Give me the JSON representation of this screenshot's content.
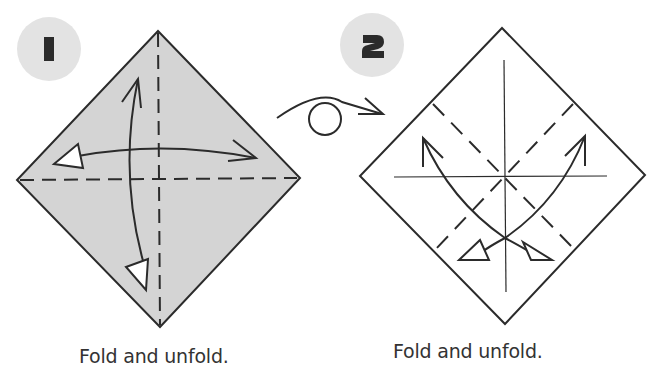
{
  "steps": [
    {
      "number": "1",
      "caption": "Fold and unfold.",
      "paper_color": "#d4d4d4",
      "folds": [
        "vertical valley fold (dashed)",
        "horizontal valley fold (dashed)"
      ],
      "arrows": [
        "double-headed vertical curved arrow",
        "double-headed horizontal curved arrow"
      ]
    },
    {
      "number": "2",
      "caption": "Fold and unfold.",
      "paper_color": "#ffffff",
      "folds": [
        "diagonal valley fold upper-left to lower-right (dashed)",
        "diagonal valley fold upper-right to lower-left (dashed)",
        "vertical crease line",
        "horizontal crease line"
      ],
      "arrows": [
        "curved double-headed arrow from upper-left to bottom",
        "curved double-headed arrow from upper-right to bottom"
      ]
    }
  ],
  "transition": {
    "symbol": "turn-over-arrow"
  },
  "colors": {
    "line": "#2b2b2b",
    "badge": "#e3e3e3",
    "paper_colored": "#d4d4d4"
  }
}
